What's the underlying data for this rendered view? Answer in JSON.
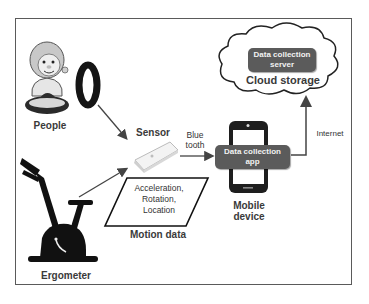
{
  "diagram": {
    "nodes": {
      "people": {
        "label": "People",
        "icon": "person-with-wristband"
      },
      "ergometer": {
        "label": "Ergometer",
        "icon": "exercise-bike"
      },
      "sensor": {
        "label": "Sensor",
        "icon": "sensor-device"
      },
      "motion_data": {
        "title": "Motion data",
        "lines": [
          "Acceleration,",
          "Rotation,",
          "Location"
        ]
      },
      "mobile_device": {
        "label_line1": "Mobile",
        "label_line2": "device",
        "app_line1": "Data collection",
        "app_line2": "app"
      },
      "cloud": {
        "label": "Cloud storage",
        "server_line1": "Data collection",
        "server_line2": "server"
      }
    },
    "edges": {
      "bluetooth_line1": "Blue",
      "bluetooth_line2": "tooth",
      "internet": "Internet"
    },
    "colors": {
      "dark_box": "#5b5b5b",
      "frame": "#5a5a5a",
      "arrow": "#444444",
      "label_text": "#3a3a3a"
    }
  }
}
